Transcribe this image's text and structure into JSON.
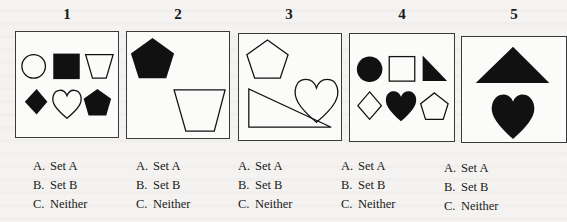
{
  "problems": [
    {
      "number": "1",
      "shapes": [
        "circle-outline",
        "square-filled",
        "trapezoid-outline",
        "diamond-filled",
        "heart-outline",
        "pentagon-filled"
      ],
      "options": [
        {
          "letter": "A.",
          "text": "Set A"
        },
        {
          "letter": "B.",
          "text": "Set B"
        },
        {
          "letter": "C.",
          "text": "Neither"
        }
      ]
    },
    {
      "number": "2",
      "shapes": [
        "pentagon-filled",
        "trapezoid-outline"
      ],
      "options": [
        {
          "letter": "A.",
          "text": "Set A"
        },
        {
          "letter": "B.",
          "text": "Set B"
        },
        {
          "letter": "C.",
          "text": "Neither"
        }
      ]
    },
    {
      "number": "3",
      "shapes": [
        "pentagon-outline",
        "heart-outline",
        "right-triangle-outline"
      ],
      "options": [
        {
          "letter": "A.",
          "text": "Set A"
        },
        {
          "letter": "B.",
          "text": "Set B"
        },
        {
          "letter": "C.",
          "text": "Neither"
        }
      ]
    },
    {
      "number": "4",
      "shapes": [
        "circle-filled",
        "square-outline",
        "right-triangle-filled",
        "diamond-outline",
        "heart-filled",
        "pentagon-outline"
      ],
      "options": [
        {
          "letter": "A.",
          "text": "Set A"
        },
        {
          "letter": "B.",
          "text": "Set B"
        },
        {
          "letter": "C.",
          "text": "Neither"
        }
      ]
    },
    {
      "number": "5",
      "shapes": [
        "triangle-filled",
        "heart-filled"
      ],
      "options": [
        {
          "letter": "A.",
          "text": "Set A"
        },
        {
          "letter": "B.",
          "text": "Set B"
        },
        {
          "letter": "C.",
          "text": "Neither"
        }
      ]
    }
  ],
  "colors": {
    "ink": "#111111",
    "paper": "#f4f3f1",
    "frame": "#3a3a3a"
  }
}
